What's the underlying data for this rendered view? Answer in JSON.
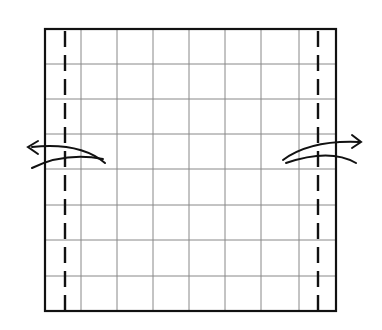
{
  "diagram": {
    "type": "origami-fold-instruction",
    "sheet": {
      "x": 45,
      "y": 29,
      "width": 291,
      "height": 282,
      "border_color": "#111111"
    },
    "grid": {
      "columns_x": [
        45,
        81,
        117,
        153,
        189,
        225,
        261,
        299,
        336
      ],
      "rows_y": [
        29,
        64,
        99,
        134,
        169,
        205,
        240,
        276,
        311
      ],
      "line_color": "#888888"
    },
    "fold_lines": [
      {
        "name": "valley-fold-left",
        "style": "dashed",
        "x": 65
      },
      {
        "name": "valley-fold-right",
        "style": "dashed",
        "x": 318
      }
    ],
    "arrows": [
      {
        "name": "fold-arrow-left",
        "direction": "left",
        "description": "Fold left flap outward"
      },
      {
        "name": "fold-arrow-right",
        "direction": "right",
        "description": "Fold right flap outward"
      }
    ]
  }
}
